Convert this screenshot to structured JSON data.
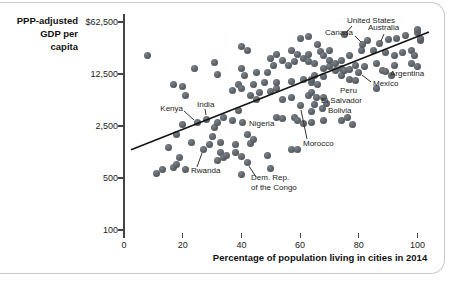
{
  "panel": {
    "background": "#ffffff",
    "border_color": "#c9c9c9"
  },
  "chart_data": {
    "type": "scatter",
    "title": "",
    "xlabel": "Percentage of population living in cities in 2014",
    "ylabel": "PPP-adjusted GDP per capita",
    "ylabel_lines": [
      "PPP-adjusted",
      "GDP per",
      "capita"
    ],
    "x_ticks": [
      0,
      20,
      40,
      60,
      80,
      100
    ],
    "y_tick_labels": [
      "$62,500",
      "12,500",
      "2,500",
      "500",
      "100"
    ],
    "y_tick_values": [
      62500,
      12500,
      2500,
      500,
      100
    ],
    "x_range": [
      0,
      100
    ],
    "y_scale": "log",
    "grid": "off",
    "legend": "none",
    "dot_color": "#565c62",
    "trend_line": {
      "x1": 2.4,
      "gdp1": 1200,
      "x2": 103.9,
      "gdp2": 45900
    },
    "points": [
      [
        8,
        22000
      ],
      [
        11,
        580
      ],
      [
        13,
        650
      ],
      [
        15,
        1300
      ],
      [
        17,
        700
      ],
      [
        17,
        9000
      ],
      [
        18,
        750
      ],
      [
        18,
        1900
      ],
      [
        19,
        950
      ],
      [
        20,
        2600
      ],
      [
        20,
        8600
      ],
      [
        21,
        650
      ],
      [
        21,
        6500
      ],
      [
        23,
        1500
      ],
      [
        24,
        15000
      ],
      [
        29,
        1400
      ],
      [
        30,
        1800
      ],
      [
        31,
        2400
      ],
      [
        31,
        18000
      ],
      [
        32,
        870
      ],
      [
        32,
        2800
      ],
      [
        32,
        12500
      ],
      [
        33,
        1100
      ],
      [
        33,
        1500
      ],
      [
        34,
        950
      ],
      [
        34,
        3300
      ],
      [
        35,
        1000
      ],
      [
        37,
        3000
      ],
      [
        37,
        7600
      ],
      [
        38,
        1100
      ],
      [
        38,
        1400
      ],
      [
        39,
        4000
      ],
      [
        39,
        9000
      ],
      [
        40,
        560
      ],
      [
        40,
        960
      ],
      [
        40,
        8000
      ],
      [
        40,
        15000
      ],
      [
        40,
        29000
      ],
      [
        41,
        12000
      ],
      [
        42,
        1900
      ],
      [
        42,
        26000
      ],
      [
        43,
        1450
      ],
      [
        43,
        6500
      ],
      [
        44,
        1650
      ],
      [
        44,
        9000
      ],
      [
        45,
        5600
      ],
      [
        45,
        13000
      ],
      [
        46,
        7000
      ],
      [
        48,
        9500
      ],
      [
        49,
        1000
      ],
      [
        49,
        13000
      ],
      [
        50,
        680
      ],
      [
        50,
        7200
      ],
      [
        50,
        20500
      ],
      [
        51,
        16500
      ],
      [
        52,
        3300
      ],
      [
        52,
        8000
      ],
      [
        52,
        9500
      ],
      [
        52,
        23000
      ],
      [
        54,
        3200
      ],
      [
        54,
        5600
      ],
      [
        54,
        19000
      ],
      [
        56,
        16500
      ],
      [
        57,
        1200
      ],
      [
        57,
        6000
      ],
      [
        57,
        10000
      ],
      [
        57,
        25500
      ],
      [
        58,
        3300
      ],
      [
        58,
        18500
      ],
      [
        59,
        1200
      ],
      [
        59,
        3000
      ],
      [
        59,
        23000
      ],
      [
        60,
        37000
      ],
      [
        61,
        2700
      ],
      [
        61,
        10500
      ],
      [
        61,
        20500
      ],
      [
        63,
        6500
      ],
      [
        63,
        18500
      ],
      [
        63,
        23000
      ],
      [
        63,
        40000
      ],
      [
        64,
        2800
      ],
      [
        64,
        3900
      ],
      [
        64,
        7000
      ],
      [
        64,
        9500
      ],
      [
        64,
        10500
      ],
      [
        65,
        4800
      ],
      [
        65,
        12000
      ],
      [
        65,
        17500
      ],
      [
        66,
        9000
      ],
      [
        66,
        31500
      ],
      [
        67,
        25000
      ],
      [
        68,
        3000
      ],
      [
        68,
        6000
      ],
      [
        68,
        11500
      ],
      [
        68,
        15000
      ],
      [
        68,
        22500
      ],
      [
        69,
        5000
      ],
      [
        70,
        16000
      ],
      [
        70,
        19000
      ],
      [
        70,
        25500
      ],
      [
        72,
        14000
      ],
      [
        72,
        17500
      ],
      [
        74,
        3000
      ],
      [
        74,
        12000
      ],
      [
        74,
        15000
      ],
      [
        74,
        19000
      ],
      [
        75,
        14000
      ],
      [
        76,
        3300
      ],
      [
        77,
        10500
      ],
      [
        77,
        14500
      ],
      [
        77,
        22500
      ],
      [
        78,
        2600
      ],
      [
        79,
        16500
      ],
      [
        81,
        26000
      ],
      [
        82,
        16000
      ],
      [
        83,
        35000
      ],
      [
        85,
        25500
      ],
      [
        86,
        8000
      ],
      [
        86,
        17500
      ],
      [
        88,
        14000
      ],
      [
        89,
        24000
      ],
      [
        90,
        36000
      ],
      [
        91,
        12000
      ],
      [
        92,
        16500
      ],
      [
        92,
        22500
      ],
      [
        93,
        38000
      ],
      [
        95,
        24000
      ],
      [
        96,
        41000
      ],
      [
        98,
        17500
      ],
      [
        98,
        25500
      ],
      [
        99,
        22500
      ],
      [
        100,
        16000
      ],
      [
        100,
        44500
      ],
      [
        100,
        49000
      ],
      [
        101,
        35000
      ],
      [
        101,
        38000
      ]
    ],
    "labeled_points": [
      {
        "name": "United States",
        "x": 75,
        "gdp": 42000,
        "label_px": 347,
        "label_py": 21,
        "align": "left",
        "leader": [
          352,
          26,
          346,
          33
        ]
      },
      {
        "name": "Canada",
        "x": 81.4,
        "gdp": 31000,
        "label_px": 353,
        "label_py": 33,
        "align": "right",
        "leader": [
          355,
          36,
          361,
          42
        ]
      },
      {
        "name": "Australia",
        "x": 87,
        "gdp": 32000,
        "label_px": 368,
        "label_py": 28,
        "align": "left",
        "leader": [
          384,
          34,
          381,
          41
        ]
      },
      {
        "name": "Argentina",
        "x": 89,
        "gdp": 13500,
        "label_px": 390,
        "label_py": 74,
        "align": "left",
        "leader": null
      },
      {
        "name": "Mexico",
        "x": 80,
        "gdp": 13000,
        "label_px": 373,
        "label_py": 84,
        "align": "left",
        "leader": [
          371,
          82,
          362,
          75
        ]
      },
      {
        "name": "Peru",
        "x": 79,
        "gdp": 10200,
        "label_px": 340,
        "label_py": 91,
        "align": "left",
        "leader": null
      },
      {
        "name": "El Salvador",
        "x": 65.5,
        "gdp": 6000,
        "label_px": 321,
        "label_py": 101,
        "align": "left",
        "leader": null
      },
      {
        "name": "Bolivia",
        "x": 67.5,
        "gdp": 4300,
        "label_px": 328,
        "label_py": 111,
        "align": "left",
        "leader": null
      },
      {
        "name": "Morocco",
        "x": 60,
        "gdp": 4650,
        "label_px": 303,
        "label_py": 144,
        "align": "left",
        "leader": [
          307,
          139,
          301,
          110
        ]
      },
      {
        "name": "Nigeria",
        "x": 40.5,
        "gdp": 2800,
        "label_px": 249,
        "label_py": 124,
        "align": "left",
        "leader": null
      },
      {
        "name": "Kenya",
        "x": 25,
        "gdp": 2750,
        "label_px": 183,
        "label_py": 109,
        "align": "right",
        "leader": [
          184,
          111,
          194,
          120
        ]
      },
      {
        "name": "India",
        "x": 28,
        "gdp": 3100,
        "label_px": 197,
        "label_py": 105,
        "align": "left",
        "leader": [
          205,
          109,
          206,
          115
        ]
      },
      {
        "name": "Rwanda",
        "x": 27,
        "gdp": 1200,
        "label_px": 191,
        "label_py": 171,
        "align": "left",
        "leader": [
          197,
          167,
          202,
          153
        ]
      },
      {
        "name": "Dem. Rep. of the Congo",
        "lines": [
          "Dem. Rep.",
          "of the Congo"
        ],
        "x": 42,
        "gdp": 820,
        "label_px": 251,
        "label_py": 183,
        "align": "left",
        "leader": [
          256,
          177,
          249,
          166
        ]
      }
    ]
  }
}
